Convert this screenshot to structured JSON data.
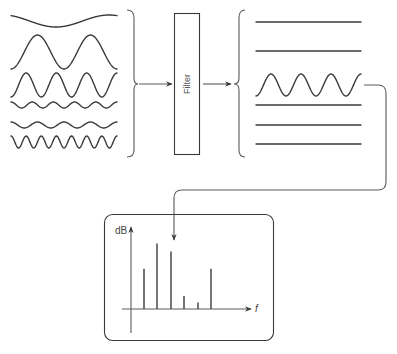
{
  "diagram": {
    "filter_label": "Filter",
    "input_signals": {
      "count": 6,
      "waves": [
        {
          "id": "w1",
          "cycles": 1,
          "amplitude": "low",
          "description": "slow low-frequency wave"
        },
        {
          "id": "w2",
          "cycles": 2,
          "amplitude": "high"
        },
        {
          "id": "w3",
          "cycles": 3.5,
          "amplitude": "medium"
        },
        {
          "id": "w4",
          "cycles": 5,
          "amplitude": "very low"
        },
        {
          "id": "w5",
          "cycles": 4,
          "amplitude": "very low"
        },
        {
          "id": "w6",
          "cycles": 7,
          "amplitude": "low"
        }
      ]
    },
    "output_signals": {
      "count": 6,
      "passed_index": 2,
      "description": "Only one frequency component passes; the rest become flat lines"
    },
    "spectrum": {
      "y_axis_label": "dB",
      "x_axis_label": "f",
      "marked_bar_index": 2,
      "bars": [
        {
          "index": 0,
          "relative_height": 0.49
        },
        {
          "index": 1,
          "relative_height": 0.8
        },
        {
          "index": 2,
          "relative_height": 0.7
        },
        {
          "index": 3,
          "relative_height": 0.16
        },
        {
          "index": 4,
          "relative_height": 0.08
        },
        {
          "index": 5,
          "relative_height": 0.49
        }
      ]
    },
    "colors": {
      "line": "#3a3a3a",
      "background": "#ffffff"
    }
  }
}
